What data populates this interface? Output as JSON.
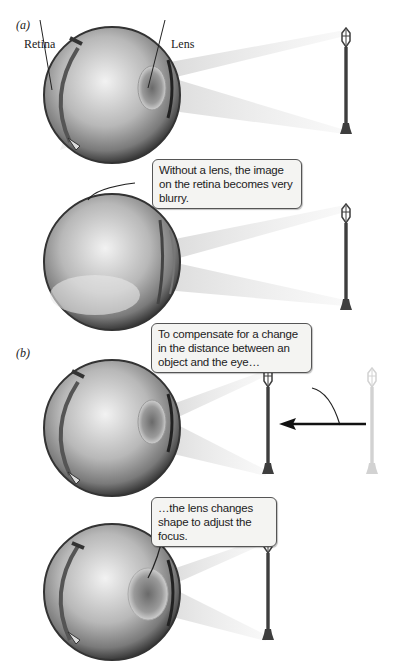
{
  "panels": [
    {
      "id": "a",
      "label": "(a)"
    },
    {
      "id": "b",
      "label": "(b)"
    }
  ],
  "labels": {
    "retina": "Retina",
    "lens": "Lens"
  },
  "callouts": {
    "no_lens": "Without a lens, the image on the retina becomes very blurry.",
    "compensate": "To compensate for a change in the distance between an object and the eye…",
    "lens_changes": "…the lens changes shape to adjust the focus."
  },
  "colors": {
    "eye_dark": "#3a3a3a",
    "eye_light": "#d8d8d8",
    "lamp_post": "#444444",
    "lamp_ghost": "#d0d0d0",
    "light_beam": "#e6e6e6",
    "arrow": "#111111",
    "callout_bg": "#f4f4f2"
  }
}
